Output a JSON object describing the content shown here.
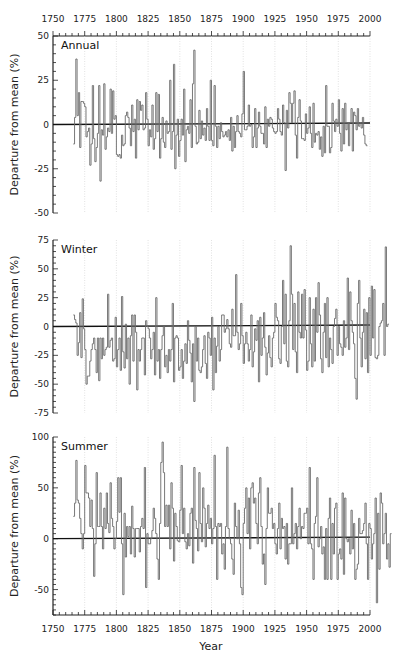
{
  "chart_data": [
    {
      "type": "line",
      "title": "Annual",
      "xlabel": "Year",
      "ylabel": "Departure from mean (%)",
      "xlim": [
        1750,
        2000
      ],
      "ylim": [
        -50,
        50
      ],
      "x_ticks": [
        1750,
        1775,
        1800,
        1825,
        1850,
        1875,
        1900,
        1925,
        1950,
        1975,
        2000
      ],
      "y_ticks": [
        -50,
        -25,
        0,
        25,
        50
      ],
      "grid": "vertical-dotted",
      "x_start": 1766,
      "values": [
        -11,
        4,
        37,
        5,
        18,
        -13,
        13,
        13,
        12,
        10,
        -7,
        -4,
        -2,
        -23,
        -11,
        22,
        -8,
        -21,
        -13,
        -5,
        22,
        -32,
        -3,
        -6,
        23,
        -14,
        -7,
        -2,
        -4,
        20,
        -5,
        19,
        3,
        5,
        -17,
        -18,
        -17,
        -19,
        -6,
        -12,
        -11,
        5,
        7,
        4,
        -2,
        -12,
        11,
        -4,
        3,
        -19,
        14,
        -3,
        13,
        8,
        11,
        -3,
        -2,
        18,
        3,
        -12,
        -3,
        -7,
        11,
        -14,
        -8,
        18,
        -4,
        17,
        -19,
        -8,
        4,
        -10,
        -13,
        2,
        -5,
        -4,
        25,
        -14,
        -4,
        34,
        -25,
        -6,
        3,
        -18,
        -9,
        3,
        -6,
        20,
        -21,
        -3,
        -1,
        -5,
        14,
        -13,
        23,
        42,
        -1,
        -11,
        -10,
        8,
        -8,
        2,
        -6,
        -2,
        -9,
        9,
        -1,
        -9,
        25,
        -9,
        -12,
        22,
        -1,
        -13,
        -1,
        -8,
        1,
        -4,
        -7,
        -6,
        -4,
        -7,
        -3,
        -9,
        4,
        -15,
        -1,
        -13,
        -4,
        5,
        -4,
        -5,
        -7,
        6,
        30,
        -3,
        -3,
        -1,
        11,
        -1,
        0,
        -13,
        -7,
        9,
        -13,
        -2,
        7,
        -1,
        -5,
        -5,
        -11,
        10,
        -13,
        3,
        -1,
        4,
        3,
        -2,
        -4,
        -5,
        -4,
        9,
        3,
        -4,
        -6,
        11,
        1,
        -26,
        8,
        -2,
        18,
        12,
        1,
        12,
        19,
        -6,
        -19,
        4,
        14,
        2,
        -8,
        -8,
        -9,
        6,
        -5,
        -2,
        10,
        -5,
        -13,
        12,
        -10,
        -5,
        -6,
        -4,
        -14,
        -7,
        -18,
        -1,
        -16,
        22,
        -1,
        -1,
        -16,
        -13,
        12,
        2,
        -4,
        3,
        -1,
        14,
        -5,
        -15,
        9,
        -11,
        12,
        -3,
        1,
        -12,
        1,
        9,
        -15,
        7,
        5,
        -3,
        9,
        -1,
        1,
        -2,
        4,
        -6,
        -11,
        -12
      ]
    },
    {
      "type": "line",
      "title": "Winter",
      "xlabel": "Year",
      "ylabel": "Departure from mean (%)",
      "xlim": [
        1750,
        2000
      ],
      "ylim": [
        -75,
        75
      ],
      "x_ticks": [
        1750,
        1775,
        1800,
        1825,
        1850,
        1875,
        1900,
        1925,
        1950,
        1975,
        2000
      ],
      "y_ticks": [
        -75,
        -50,
        -25,
        0,
        25,
        50,
        75
      ],
      "grid": "vertical-dotted",
      "x_start": 1766,
      "values": [
        10,
        6,
        3,
        -25,
        -14,
        12,
        -27,
        24,
        -2,
        -20,
        -50,
        -43,
        -43,
        -30,
        -20,
        -15,
        -10,
        -20,
        -40,
        -10,
        -47,
        -10,
        -28,
        -10,
        -25,
        -20,
        -18,
        28,
        -18,
        -12,
        -10,
        -30,
        -28,
        8,
        -35,
        -20,
        -10,
        -38,
        26,
        -22,
        -36,
        2,
        -28,
        -10,
        -50,
        -8,
        10,
        -30,
        10,
        -5,
        -55,
        -20,
        -30,
        -20,
        -10,
        -10,
        -42,
        5,
        0,
        -2,
        -10,
        -28,
        -20,
        -5,
        -42,
        25,
        -30,
        -20,
        -45,
        -20,
        -8,
        0,
        -35,
        -25,
        -40,
        -20,
        -30,
        -20,
        20,
        -48,
        -10,
        -8,
        -10,
        -38,
        -35,
        -20,
        -45,
        -30,
        -15,
        -32,
        5,
        -12,
        -23,
        -48,
        -15,
        -65,
        0,
        -30,
        -10,
        -38,
        -40,
        -35,
        -20,
        -8,
        -32,
        -45,
        -5,
        -10,
        -25,
        8,
        -55,
        -10,
        -40,
        -17,
        0,
        -30,
        -20,
        10,
        10,
        -5,
        -2,
        6,
        -2,
        -15,
        -18,
        15,
        -8,
        -8,
        45,
        -5,
        -20,
        -15,
        20,
        -8,
        -32,
        -15,
        -5,
        -15,
        -30,
        -20,
        10,
        -35,
        -22,
        -2,
        -12,
        5,
        -48,
        8,
        -25,
        -10,
        12,
        -18,
        -42,
        -23,
        -8,
        -27,
        -35,
        -10,
        -5,
        20,
        8,
        5,
        -28,
        -32,
        0,
        40,
        -15,
        28,
        -30,
        -35,
        5,
        70,
        28,
        -20,
        20,
        -22,
        -40,
        30,
        -5,
        -10,
        28,
        -10,
        32,
        -3,
        -38,
        -30,
        25,
        -15,
        -35,
        15,
        -30,
        25,
        -5,
        38,
        10,
        -28,
        -40,
        -5,
        20,
        -27,
        25,
        -35,
        -10,
        -20,
        -32,
        0,
        7,
        15,
        -25,
        0,
        -15,
        -18,
        -25,
        5,
        -18,
        -10,
        42,
        -20,
        30,
        5,
        -5,
        -15,
        -45,
        -63,
        20,
        40,
        -10,
        -35,
        -5,
        15,
        -28,
        12,
        -40,
        25,
        -25,
        35,
        -10,
        32,
        -27,
        -28,
        -25,
        0,
        3,
        5,
        20,
        -25,
        69,
        0,
        2
      ]
    },
    {
      "type": "line",
      "title": "Summer",
      "xlabel": "Year",
      "ylabel": "Departure from mean (%)",
      "xlim": [
        1750,
        2000
      ],
      "ylim": [
        -75,
        100
      ],
      "x_ticks": [
        1750,
        1775,
        1800,
        1825,
        1850,
        1875,
        1900,
        1925,
        1950,
        1975,
        2000
      ],
      "y_ticks": [
        -50,
        0,
        50,
        100
      ],
      "grid": "vertical-dotted",
      "x_start": 1766,
      "values": [
        22,
        35,
        77,
        38,
        35,
        20,
        5,
        -10,
        5,
        72,
        45,
        45,
        40,
        12,
        38,
        10,
        -37,
        -5,
        65,
        12,
        12,
        45,
        12,
        -10,
        30,
        10,
        45,
        15,
        6,
        55,
        20,
        12,
        -10,
        0,
        17,
        60,
        26,
        60,
        -5,
        -55,
        25,
        -18,
        12,
        2,
        12,
        -15,
        32,
        10,
        -18,
        10,
        10,
        10,
        -13,
        12,
        20,
        10,
        70,
        -48,
        5,
        -5,
        -5,
        0,
        8,
        30,
        20,
        5,
        -20,
        -40,
        15,
        75,
        95,
        65,
        12,
        33,
        12,
        33,
        -10,
        55,
        30,
        -22,
        25,
        12,
        -2,
        -3,
        28,
        72,
        5,
        30,
        -3,
        -10,
        5,
        -7,
        25,
        30,
        -24,
        70,
        18,
        10,
        -12,
        65,
        15,
        -3,
        50,
        30,
        -8,
        15,
        33,
        10,
        20,
        -5,
        10,
        82,
        12,
        -40,
        15,
        12,
        15,
        -15,
        -5,
        -30,
        12,
        90,
        10,
        0,
        -5,
        -20,
        -35,
        35,
        12,
        0,
        28,
        -5,
        -48,
        -55,
        15,
        30,
        50,
        5,
        40,
        -10,
        50,
        55,
        35,
        40,
        15,
        -5,
        45,
        60,
        12,
        -25,
        -15,
        -45,
        10,
        50,
        25,
        25,
        30,
        10,
        15,
        -5,
        -15,
        10,
        35,
        -10,
        20,
        10,
        12,
        -20,
        15,
        -25,
        -5,
        -5,
        50,
        -5,
        5,
        15,
        -10,
        12,
        30,
        0,
        12,
        10,
        25,
        25,
        30,
        -5,
        70,
        -5,
        -10,
        -40,
        15,
        22,
        60,
        -8,
        0,
        12,
        -15,
        -8,
        -40,
        10,
        -40,
        20,
        40,
        -40,
        15,
        -15,
        30,
        35,
        -40,
        -15,
        -10,
        -20,
        45,
        -35,
        40,
        0,
        -3,
        0,
        -15,
        28,
        -10,
        15,
        -40,
        -30,
        -25,
        20,
        5,
        5,
        8,
        15,
        35,
        -5,
        -40,
        15,
        10,
        -20,
        -5,
        5,
        40,
        -63,
        25,
        -30,
        45,
        35,
        -5,
        5,
        25,
        -20,
        -5,
        -28,
        5
      ]
    }
  ],
  "labels": {
    "year": "Year",
    "ylabel": "Departure from mean (%)"
  }
}
